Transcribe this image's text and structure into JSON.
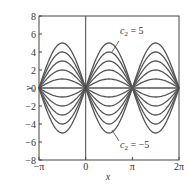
{
  "chart_data": {
    "type": "line",
    "title": "",
    "xlabel": "x",
    "ylabel": "y",
    "function": "y = c2 sin x",
    "xlim": [
      -3.14159,
      6.28319
    ],
    "ylim": [
      -8,
      8
    ],
    "xticks": [
      "-π",
      "0",
      "π",
      "2π"
    ],
    "yticks": [
      "8",
      "6",
      "4",
      "2",
      "0",
      "-2",
      "-4",
      "-6",
      "-8"
    ],
    "series": [
      {
        "name": "c2 = 5",
        "c2": 5
      },
      {
        "name": "c2 = 4",
        "c2": 4
      },
      {
        "name": "c2 = 3",
        "c2": 3
      },
      {
        "name": "c2 = 2",
        "c2": 2
      },
      {
        "name": "c2 = 1",
        "c2": 1
      },
      {
        "name": "c2 = 0",
        "c2": 0
      },
      {
        "name": "c2 = -1",
        "c2": -1
      },
      {
        "name": "c2 = -2",
        "c2": -2
      },
      {
        "name": "c2 = -3",
        "c2": -3
      },
      {
        "name": "c2 = -4",
        "c2": -4
      },
      {
        "name": "c2 = -5",
        "c2": -5
      }
    ],
    "annotations": [
      {
        "text": "c2 = 5",
        "sub": "2",
        "base": "c",
        "rhs": " = 5"
      },
      {
        "text": "c2 = −5",
        "sub": "2",
        "base": "c",
        "rhs": " = −5"
      }
    ],
    "grid": false,
    "line_color": "#555555"
  }
}
